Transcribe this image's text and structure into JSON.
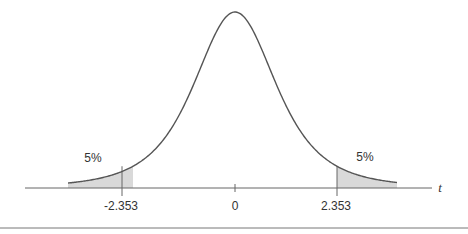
{
  "chart_data": {
    "type": "area",
    "title": "",
    "xlabel": "t",
    "ylabel": "",
    "x_tick_labels": [
      "-2.353",
      "0",
      "2.353"
    ],
    "x_ticks": [
      -2.353,
      0,
      2.353
    ],
    "critical_values": {
      "left": -2.353,
      "right": 2.353
    },
    "shaded_regions": [
      {
        "side": "left",
        "from": "-inf",
        "to": -2.353,
        "area_label": "5%",
        "area": 0.05
      },
      {
        "side": "right",
        "from": 2.353,
        "to": "inf",
        "area_label": "5%",
        "area": 0.05
      }
    ],
    "degrees_of_freedom": 3,
    "grid": false,
    "legend": "none"
  },
  "labels": {
    "left_tail": "5%",
    "right_tail": "5%",
    "left_crit": "-2.353",
    "center": "0",
    "right_crit": "2.353",
    "axis_var": "t"
  },
  "colors": {
    "curve": "#555555",
    "shade": "#d9d9d9",
    "axis": "#666666",
    "rule": "#777777"
  }
}
